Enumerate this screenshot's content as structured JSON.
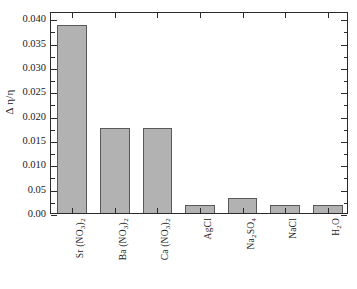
{
  "chart_data": {
    "type": "bar",
    "title": "",
    "subtitle": "",
    "xlabel": "",
    "ylabel": "Δ η/η",
    "ylim": [
      0.0,
      0.0415
    ],
    "grid": false,
    "legend": "none",
    "categories": [
      "Sr (NO3)2",
      "Ba (NO3)2",
      "Ca (NO3)2",
      "AgCl",
      "Na2SO4",
      "NaCl",
      "H2O"
    ],
    "values": [
      0.0387,
      0.0175,
      0.0175,
      0.0017,
      0.003,
      0.0017,
      0.0017
    ],
    "bar_color": "#b2b2b2",
    "bar_edge_color": "#595959",
    "axis_color": "#2a2a2a",
    "ytick_labels": [
      "0.00",
      "0.05",
      "0.010",
      "0.015",
      "0.020",
      "0.025",
      "0.030",
      "0.035",
      "0.040"
    ],
    "ytick_values": [
      0.0,
      0.005,
      0.01,
      0.015,
      0.02,
      0.025,
      0.03,
      0.035,
      0.04
    ]
  },
  "axes": {
    "y_title": "Δ η/η"
  },
  "categories_rich": [
    {
      "prefix": "Sr",
      "group": "NO",
      "group_sub": "3",
      "outer_sub": "2",
      "plain": ""
    },
    {
      "prefix": "Ba",
      "group": "NO",
      "group_sub": "3",
      "outer_sub": "2",
      "plain": ""
    },
    {
      "prefix": "Ca",
      "group": "NO",
      "group_sub": "3",
      "outer_sub": "2",
      "plain": ""
    },
    {
      "prefix": "",
      "group": "",
      "group_sub": "",
      "outer_sub": "",
      "plain": "AgCl"
    },
    {
      "prefix": "Na",
      "group": "",
      "group_sub": "",
      "outer_sub": "",
      "plain": ""
    },
    {
      "prefix": "",
      "group": "",
      "group_sub": "",
      "outer_sub": "",
      "plain": "NaCl"
    },
    {
      "prefix": "",
      "group": "",
      "group_sub": "",
      "outer_sub": "",
      "plain": ""
    }
  ]
}
